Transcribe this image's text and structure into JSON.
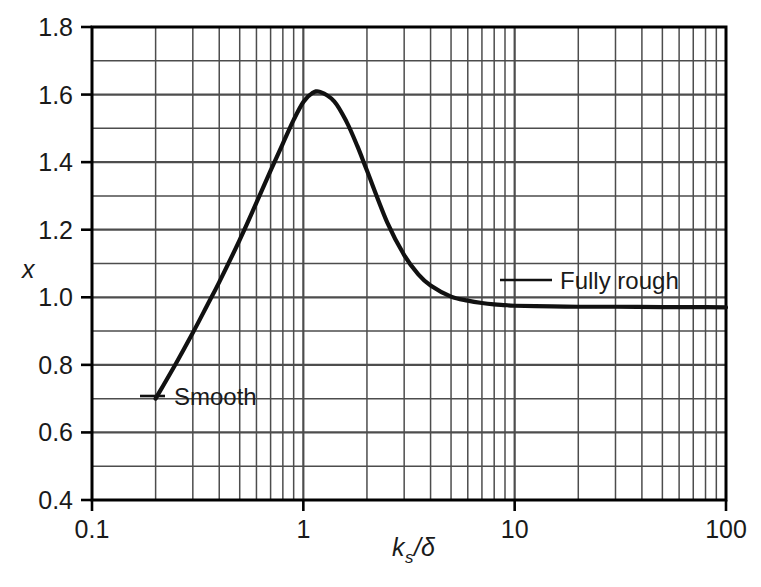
{
  "figure": {
    "background_color": "#ffffff",
    "line_color": "#111111",
    "grid_color": "#4d4d4d",
    "axis_color": "#000000"
  },
  "axes": {
    "x": {
      "label_parts": {
        "base": "k",
        "sub": "s",
        "tail": "/δ"
      },
      "label_text": "k_s/δ",
      "scale": "log",
      "range": [
        0.1,
        100
      ],
      "major_ticks": [
        "0.1",
        "1",
        "10",
        "100"
      ],
      "major_tick_values": [
        0.1,
        1,
        10,
        100
      ]
    },
    "y": {
      "label_text": "x",
      "scale": "linear",
      "range": [
        0.4,
        1.8
      ],
      "major_ticks": [
        "0.4",
        "0.6",
        "0.8",
        "1.0",
        "1.2",
        "1.4",
        "1.6",
        "1.8"
      ],
      "major_tick_values": [
        0.4,
        0.6,
        0.8,
        1.0,
        1.2,
        1.4,
        1.6,
        1.8
      ],
      "minor_tick_step": 0.1
    }
  },
  "annotations": [
    {
      "id": "smooth",
      "text": "Smooth",
      "x_px": 170,
      "y_px": 404,
      "leader": true
    },
    {
      "id": "fully-rough",
      "text": "Fully rough",
      "x_px": 555,
      "y_px": 287,
      "leader": true
    }
  ],
  "chart_data": {
    "type": "line",
    "title": "",
    "xlabel": "k_s/δ",
    "ylabel": "x",
    "xscale": "log",
    "yscale": "linear",
    "xlim": [
      0.1,
      100
    ],
    "ylim": [
      0.4,
      1.8
    ],
    "grid": true,
    "legend": null,
    "annotations": [
      "Smooth",
      "Fully rough"
    ],
    "series": [
      {
        "name": "x vs ks/delta",
        "x": [
          0.2,
          0.25,
          0.3,
          0.35,
          0.4,
          0.5,
          0.6,
          0.7,
          0.8,
          0.9,
          1.0,
          1.1,
          1.2,
          1.4,
          1.6,
          1.8,
          2.0,
          2.5,
          3.0,
          3.5,
          4.0,
          5.0,
          6.0,
          7.0,
          8.0,
          9.0,
          10.0,
          15.0,
          20.0,
          30.0,
          50.0,
          70.0,
          100.0
        ],
        "y": [
          0.7,
          0.805,
          0.895,
          0.975,
          1.045,
          1.17,
          1.28,
          1.375,
          1.455,
          1.525,
          1.578,
          1.604,
          1.608,
          1.58,
          1.52,
          1.448,
          1.375,
          1.22,
          1.125,
          1.068,
          1.035,
          1.002,
          0.99,
          0.983,
          0.979,
          0.977,
          0.975,
          0.973,
          0.972,
          0.972,
          0.971,
          0.971,
          0.97
        ]
      }
    ],
    "notable_points": {
      "peak": {
        "x": 1.15,
        "y": 1.61
      },
      "start": {
        "x": 0.2,
        "y": 0.7
      },
      "asymptote_y": 0.97
    }
  }
}
